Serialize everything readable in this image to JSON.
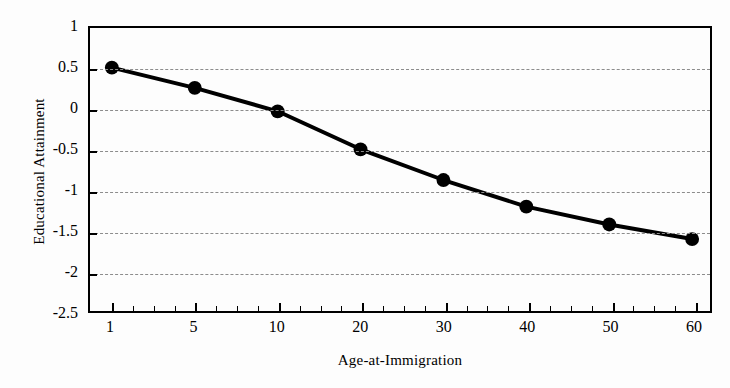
{
  "chart_data": {
    "type": "line",
    "title": "",
    "xlabel": "Age-at-Immigration",
    "ylabel": "Educational Attainment",
    "categories": [
      "1",
      "5",
      "10",
      "20",
      "30",
      "40",
      "50",
      "60"
    ],
    "values": [
      0.51,
      0.26,
      -0.03,
      -0.5,
      -0.88,
      -1.21,
      -1.43,
      -1.61
    ],
    "series": [
      {
        "name": "Educational Attainment",
        "values": [
          0.51,
          0.26,
          -0.03,
          -0.5,
          -0.88,
          -1.21,
          -1.43,
          -1.61
        ]
      }
    ],
    "ylim": [
      -2.5,
      1
    ],
    "yticks": [
      "1",
      "0.5",
      "0",
      "-0.5",
      "-1",
      "-1.5",
      "-2",
      "-2.5"
    ],
    "ytick_values": [
      1,
      0.5,
      0,
      -0.5,
      -1,
      -1.5,
      -2,
      -2.5
    ],
    "grid": true,
    "grid_style": "dashed",
    "grid_color": "#8c8c8c",
    "legend": "none",
    "line_color": "#000000",
    "marker": "filled-circle",
    "marker_color": "#000000",
    "background": "#fdfdfd",
    "frame_color": "#000000"
  }
}
